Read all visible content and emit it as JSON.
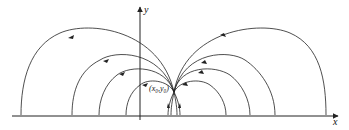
{
  "diagram": {
    "axes": {
      "x_label": "x",
      "y_label": "y"
    },
    "point_label": "(x0,y0)",
    "point_label_display": "(x₀,y₀)",
    "left_arcs": 4,
    "right_arcs": 4,
    "stroke_color": "#222222"
  }
}
